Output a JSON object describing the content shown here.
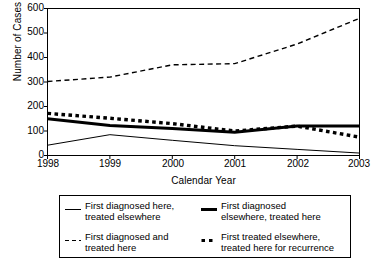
{
  "chart_data": {
    "type": "line",
    "title": "",
    "xlabel": "Calendar Year",
    "ylabel": "Number of Cases",
    "x": [
      1998,
      1999,
      2000,
      2001,
      2002,
      2003
    ],
    "xticklabels": [
      "1998",
      "1999",
      "2000",
      "2001",
      "2002",
      "2003"
    ],
    "yticklabels": [
      "0",
      "100",
      "200",
      "300",
      "400",
      "500",
      "600"
    ],
    "yticks": [
      0,
      100,
      200,
      300,
      400,
      500,
      600
    ],
    "ylim": [
      0,
      600
    ],
    "xlim": [
      1998,
      2003
    ],
    "grid": false,
    "legend_position": "below-plot",
    "series": [
      {
        "name": "First diagnosed here, treated elsewhere",
        "style": "thin-solid",
        "values": [
          42,
          85,
          62,
          40,
          25,
          10
        ]
      },
      {
        "name": "First diagnosed elsewhere, treated here",
        "style": "thick-solid",
        "values": [
          150,
          122,
          110,
          95,
          120,
          120
        ]
      },
      {
        "name": "First diagnosed and treated here",
        "style": "thin-dashed",
        "values": [
          302,
          320,
          370,
          375,
          455,
          560
        ]
      },
      {
        "name": "First treated elsewhere, treated here for recurrence",
        "style": "thick-dotted",
        "values": [
          172,
          152,
          130,
          100,
          120,
          75
        ]
      }
    ]
  },
  "legend": {
    "entries": [
      {
        "label_line1": "First diagnosed here,",
        "label_line2": "treated elsewhere",
        "style": "thin-solid"
      },
      {
        "label_line1": "First diagnosed",
        "label_line2": "elsewhere, treated here",
        "style": "thick-solid"
      },
      {
        "label_line1": "First diagnosed and",
        "label_line2": "treated here",
        "style": "thin-dashed"
      },
      {
        "label_line1": "First treated elsewhere,",
        "label_line2": "treated here for recurrence",
        "style": "thick-dotted"
      }
    ]
  },
  "colors": {
    "line": "#000000",
    "frame": "#000000",
    "background": "#ffffff"
  }
}
